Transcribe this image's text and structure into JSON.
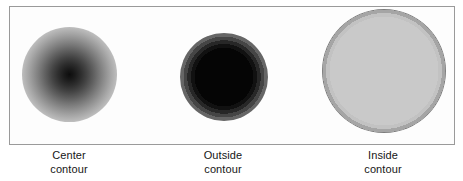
{
  "figure": {
    "panel": {
      "border_color": "#9a9a9a",
      "background_color": "#fdfdfd"
    },
    "shapes": [
      {
        "id": "center-contour",
        "style": "radial-gradient-dark-center",
        "description": "Filled circle shaded darkest at the center, fading smoothly to white at the rim"
      },
      {
        "id": "outside-contour",
        "style": "banded-black-core",
        "description": "Circle with a solid black core surrounded by concentric gray bands that lighten outward"
      },
      {
        "id": "inside-contour",
        "style": "banded-black-ring",
        "description": "Circle with a thick black outer ring and a flat light gray interior"
      }
    ],
    "captions": [
      {
        "line1": "Center",
        "line2": "contour"
      },
      {
        "line1": "Outside",
        "line2": "contour"
      },
      {
        "line1": "Inside",
        "line2": "contour"
      }
    ]
  }
}
